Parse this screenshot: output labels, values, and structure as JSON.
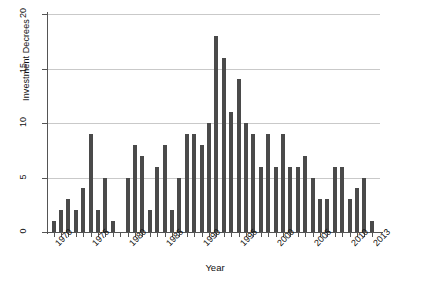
{
  "chart_data": {
    "type": "bar",
    "title": "",
    "subtitle": "",
    "xlabel": "Year",
    "ylabel": "Investment Decrees",
    "categories": [
      "1970",
      "1971",
      "1972",
      "1973",
      "1974",
      "1975",
      "1976",
      "1977",
      "1978",
      "1979",
      "1980",
      "1981",
      "1982",
      "1983",
      "1984",
      "1985",
      "1986",
      "1987",
      "1988",
      "1989",
      "1990",
      "1991",
      "1992",
      "1993",
      "1994",
      "1995",
      "1996",
      "1997",
      "1998",
      "1999",
      "2000",
      "2001",
      "2002",
      "2003",
      "2004",
      "2005",
      "2006",
      "2007",
      "2008",
      "2009",
      "2010",
      "2011",
      "2012",
      "2013"
    ],
    "values": [
      1,
      2,
      3,
      2,
      4,
      9,
      2,
      5,
      1,
      0,
      5,
      8,
      7,
      2,
      6,
      8,
      2,
      5,
      9,
      9,
      8,
      10,
      18,
      16,
      11,
      14,
      10,
      9,
      6,
      9,
      6,
      9,
      6,
      6,
      7,
      5,
      3,
      3,
      6,
      6,
      3,
      4,
      5,
      1
    ],
    "xlim": [
      "1970",
      "2013"
    ],
    "ylim": [
      0,
      20
    ],
    "ytick_labels": [
      "0",
      "5",
      "10",
      "15",
      "20"
    ],
    "ytick_values": [
      0,
      5,
      10,
      15,
      20
    ],
    "xtick_labels": [
      "1970",
      "1975",
      "1980",
      "1985",
      "1990",
      "1995",
      "2000",
      "2005",
      "2010",
      "2013"
    ],
    "grid": "horizontal",
    "legend": "none",
    "bar_color": "#4a4a4a",
    "background_color": "#ffffff",
    "gridline_color": "#c9c9c9",
    "axis_color": "#555555"
  }
}
